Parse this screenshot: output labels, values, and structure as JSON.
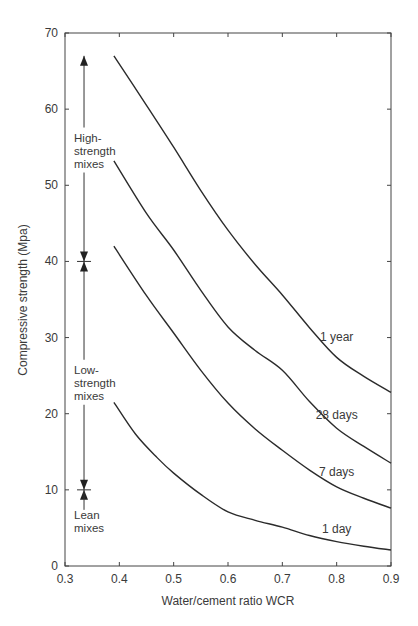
{
  "chart_data": {
    "type": "line",
    "title": "",
    "xlabel": "Water/cement ratio WCR",
    "ylabel": "Compressive strength (Mpa)",
    "xlim": [
      0.3,
      0.9
    ],
    "ylim": [
      0,
      70
    ],
    "xticks": [
      0.3,
      0.4,
      0.5,
      0.6,
      0.7,
      0.8,
      0.9
    ],
    "xtick_labels": [
      "0.3",
      "0.4",
      "0.5",
      "0.6",
      "0.7",
      "0.8",
      "0.9"
    ],
    "yticks": [
      0,
      10,
      20,
      30,
      40,
      50,
      60,
      70
    ],
    "ytick_labels": [
      "0",
      "10",
      "20",
      "30",
      "40",
      "50",
      "60",
      "70"
    ],
    "grid": false,
    "legend": "inline labels at right",
    "series": [
      {
        "name": "1 year",
        "label_pos": [
          0.8,
          29.5
        ],
        "x": [
          0.39,
          0.45,
          0.5,
          0.55,
          0.6,
          0.65,
          0.7,
          0.75,
          0.8,
          0.85,
          0.9
        ],
        "y": [
          67.0,
          60.5,
          55.0,
          49.3,
          44.1,
          39.6,
          35.6,
          31.3,
          27.4,
          24.9,
          22.8
        ]
      },
      {
        "name": "28 days",
        "label_pos": [
          0.8,
          19.3
        ],
        "x": [
          0.39,
          0.45,
          0.5,
          0.55,
          0.6,
          0.65,
          0.7,
          0.75,
          0.8,
          0.85,
          0.9
        ],
        "y": [
          53.2,
          46.3,
          41.5,
          36.2,
          31.4,
          28.3,
          25.7,
          21.6,
          18.1,
          15.7,
          13.5
        ]
      },
      {
        "name": "7 days",
        "label_pos": [
          0.8,
          11.8
        ],
        "x": [
          0.39,
          0.45,
          0.5,
          0.55,
          0.6,
          0.65,
          0.7,
          0.75,
          0.8,
          0.85,
          0.9
        ],
        "y": [
          42.0,
          35.5,
          30.6,
          25.7,
          21.4,
          18.0,
          15.2,
          12.6,
          10.4,
          8.9,
          7.6
        ]
      },
      {
        "name": "1 day",
        "label_pos": [
          0.8,
          4.3
        ],
        "x": [
          0.39,
          0.43,
          0.47,
          0.5,
          0.55,
          0.6,
          0.65,
          0.7,
          0.75,
          0.8,
          0.85,
          0.9
        ],
        "y": [
          21.5,
          17.3,
          14.2,
          12.2,
          9.4,
          7.1,
          6.0,
          5.1,
          4.0,
          3.2,
          2.6,
          2.1
        ]
      }
    ],
    "annotations": [
      {
        "text": [
          "High-",
          "strength",
          "mixes"
        ],
        "range": [
          40,
          67
        ],
        "arrow_x": 0.335
      },
      {
        "text": [
          "Low-",
          "strength",
          "mixes"
        ],
        "range": [
          10,
          40
        ],
        "arrow_x": 0.335
      },
      {
        "text": [
          "Lean",
          "mixes"
        ],
        "range": [
          0,
          10
        ],
        "arrow_x": 0.335
      }
    ]
  }
}
